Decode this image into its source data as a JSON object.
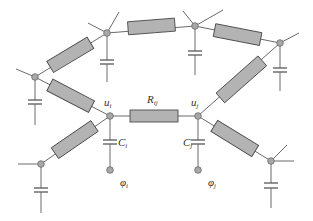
{
  "diagram": {
    "colors": {
      "wire": "#6a6a6a",
      "resistor_fill": "#b3b3b3",
      "resistor_stroke": "#4a4a4a",
      "node_fill": "#a8a8a8"
    },
    "labels": {
      "u_i": {
        "main": "u",
        "sub": "i"
      },
      "u_j": {
        "main": "u",
        "sub": "j"
      },
      "R_ij": {
        "main": "R",
        "sub": "ij"
      },
      "C_i": {
        "main": "C",
        "sub": "i"
      },
      "C_j": {
        "main": "C",
        "sub": "j"
      },
      "phi_i": {
        "main": "φ",
        "sub": "i"
      },
      "phi_j": {
        "main": "φ",
        "sub": "j"
      }
    },
    "nodes": [
      {
        "id": "A",
        "x": 107,
        "y": 33
      },
      {
        "id": "B",
        "x": 195,
        "y": 26
      },
      {
        "id": "C",
        "x": 280,
        "y": 43
      },
      {
        "id": "D",
        "x": 35,
        "y": 77
      },
      {
        "id": "ui",
        "x": 110,
        "y": 116
      },
      {
        "id": "uj",
        "x": 198,
        "y": 116
      },
      {
        "id": "E",
        "x": 41,
        "y": 164
      },
      {
        "id": "F",
        "x": 271,
        "y": 161
      }
    ],
    "terminals": [
      {
        "id": "phi_i_terminal",
        "x": 110,
        "y": 170
      },
      {
        "id": "phi_j_terminal",
        "x": 198,
        "y": 170
      }
    ]
  }
}
